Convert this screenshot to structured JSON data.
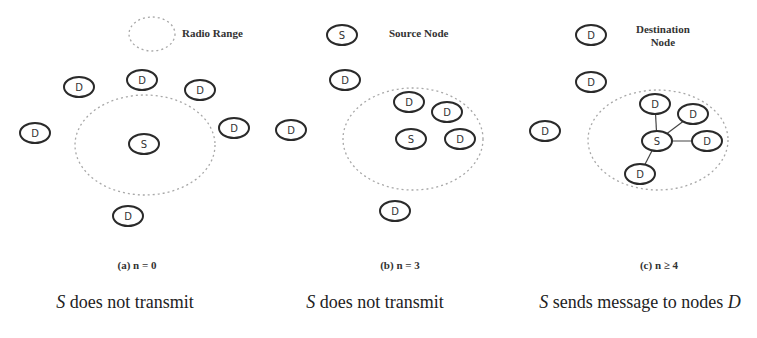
{
  "legend": {
    "radio_range": "Radio Range",
    "source_node": "Source Node",
    "destination_node_line1": "Destination",
    "destination_node_line2": "Node",
    "source_symbol": "S",
    "destination_symbol": "D"
  },
  "panels": [
    {
      "caption": "(a) n = 0",
      "description_subject": "S",
      "description_text": " does not transmit",
      "source": {
        "label": "S",
        "x": 144,
        "y": 144
      },
      "range": {
        "cx": 145,
        "cy": 145,
        "rx": 70,
        "ry": 50
      },
      "destinations": [
        {
          "label": "D",
          "x": 79,
          "y": 87
        },
        {
          "label": "D",
          "x": 142,
          "y": 80
        },
        {
          "label": "D",
          "x": 200,
          "y": 90
        },
        {
          "label": "D",
          "x": 35,
          "y": 133
        },
        {
          "label": "D",
          "x": 234,
          "y": 128
        },
        {
          "label": "D",
          "x": 128,
          "y": 216
        }
      ],
      "links": []
    },
    {
      "caption": "(b) n = 3",
      "description_subject": "S",
      "description_text": " does not transmit",
      "source": {
        "label": "S",
        "x": 411,
        "y": 139
      },
      "range": {
        "cx": 413,
        "cy": 139,
        "rx": 70,
        "ry": 51
      },
      "destinations": [
        {
          "label": "D",
          "x": 345,
          "y": 80
        },
        {
          "label": "D",
          "x": 291,
          "y": 130
        },
        {
          "label": "D",
          "x": 409,
          "y": 102
        },
        {
          "label": "D",
          "x": 447,
          "y": 112
        },
        {
          "label": "D",
          "x": 460,
          "y": 139
        },
        {
          "label": "D",
          "x": 395,
          "y": 211
        }
      ],
      "links": []
    },
    {
      "caption": "(c) n ≥ 4",
      "description_subject": "S",
      "description_text": " sends message to nodes ",
      "description_object": "D",
      "source": {
        "label": "S",
        "x": 657,
        "y": 141
      },
      "range": {
        "cx": 658,
        "cy": 140,
        "rx": 70,
        "ry": 50
      },
      "destinations": [
        {
          "label": "D",
          "x": 591,
          "y": 82
        },
        {
          "label": "D",
          "x": 545,
          "y": 131
        },
        {
          "label": "D",
          "x": 655,
          "y": 104
        },
        {
          "label": "D",
          "x": 693,
          "y": 114
        },
        {
          "label": "D",
          "x": 707,
          "y": 141
        },
        {
          "label": "D",
          "x": 640,
          "y": 174
        }
      ],
      "links": [
        [
          657,
          141,
          655,
          104
        ],
        [
          657,
          141,
          693,
          114
        ],
        [
          657,
          141,
          707,
          141
        ],
        [
          657,
          141,
          640,
          174
        ]
      ]
    }
  ],
  "colors": {
    "node_stroke": "#2a2a2a",
    "range_stroke": "#a8a8a8",
    "link": "#444444",
    "text": "#333333"
  }
}
